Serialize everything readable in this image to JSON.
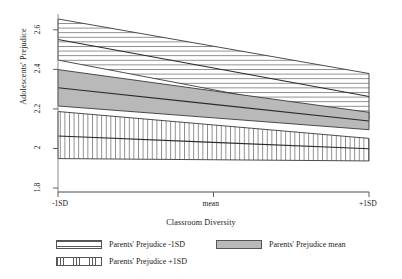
{
  "chart_data": {
    "type": "area",
    "title": "",
    "xlabel": "Classroom Diversity",
    "ylabel": "Adolescents' Prejudice",
    "x": [
      "-1SD",
      "mean",
      "+1SD"
    ],
    "x_positions": [
      0,
      0.5,
      1
    ],
    "ylim": [
      1.8,
      2.65
    ],
    "yticks": [
      1.8,
      2,
      2.2,
      2.4,
      2.6
    ],
    "ytick_labels": [
      "1.8",
      "2",
      "2.2",
      "2.4",
      "2.6"
    ],
    "xtick_labels": [
      "-1SD",
      "mean",
      "+1SD"
    ],
    "grid": false,
    "legend_position": "bottom",
    "series": [
      {
        "name": "Parents' Prejudice -1SD",
        "fill": "horizontal-hatch",
        "color": "#666666",
        "line": [
          2.551,
          2.407,
          2.263
        ],
        "upper": [
          2.655,
          2.517,
          2.379
        ],
        "lower": [
          2.447,
          2.297,
          2.147
        ]
      },
      {
        "name": "Parents' Prejudice mean",
        "fill": "solid-gray",
        "color": "#b3b3b3",
        "line": [
          2.307,
          2.223,
          2.139
        ],
        "upper": [
          2.399,
          2.291,
          2.183
        ],
        "lower": [
          2.215,
          2.155,
          2.095
        ]
      },
      {
        "name": "Parents' Prejudice +1SD",
        "fill": "vertical-hatch",
        "color": "#666666",
        "line": [
          2.063,
          2.031,
          1.999
        ],
        "upper": [
          2.187,
          2.119,
          2.051
        ],
        "lower": [
          1.949,
          1.943,
          1.937
        ]
      }
    ]
  },
  "axes": {
    "y_label": "Adolescents' Prejudice",
    "x_label": "Classroom Diversity",
    "y_ticks": [
      "2.6",
      "2.4",
      "2.2",
      "2",
      "1.8"
    ],
    "x_ticks": [
      "-1SD",
      "mean",
      "+1SD"
    ]
  },
  "legend": {
    "items": [
      {
        "label": "Parents' Prejudice -1SD",
        "pattern": "horizontal-hatch"
      },
      {
        "label": "Parents' Prejudice mean",
        "pattern": "solid-gray"
      },
      {
        "label": "Parents' Prejudice +1SD",
        "pattern": "vertical-hatch"
      }
    ]
  }
}
